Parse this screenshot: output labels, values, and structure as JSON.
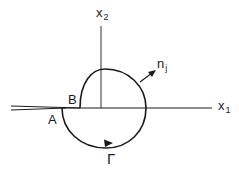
{
  "diagram": {
    "type": "contour-around-crack-tip",
    "colors": {
      "stroke": "#1a1a1a",
      "background": "#ffffff"
    },
    "axes": {
      "x1": {
        "label": "x",
        "subscript": "1"
      },
      "x2": {
        "label": "x",
        "subscript": "2"
      }
    },
    "points": {
      "A": "A",
      "B": "B"
    },
    "normal": {
      "label": "n",
      "subscript": "j"
    },
    "contour": {
      "label": "Γ",
      "direction": "counterclockwise"
    }
  }
}
